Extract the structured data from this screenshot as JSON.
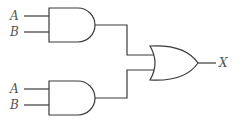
{
  "diagram": {
    "type": "logic-circuit",
    "gates": [
      {
        "id": "and1",
        "kind": "AND",
        "inputs": [
          "A",
          "B"
        ]
      },
      {
        "id": "and2",
        "kind": "AND",
        "inputs": [
          "A",
          "B"
        ]
      },
      {
        "id": "or1",
        "kind": "OR",
        "inputs": [
          "and1",
          "and2"
        ],
        "output": "X"
      }
    ],
    "labels": {
      "top_a": "A",
      "top_b": "B",
      "bottom_a": "A",
      "bottom_b": "B",
      "output": "X"
    }
  }
}
